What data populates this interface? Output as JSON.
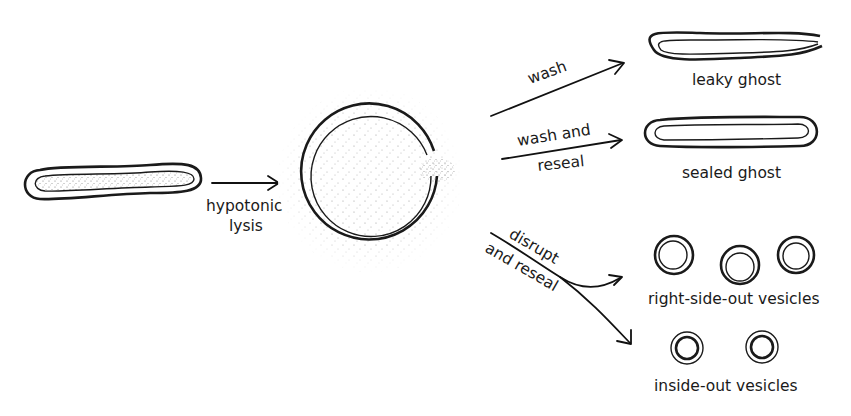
{
  "diagram": {
    "nodes": [
      {
        "id": "cell",
        "label": "",
        "shape": "rod with stippled cytoplasm"
      },
      {
        "id": "lysed",
        "label": "",
        "shape": "swollen circle with gap, stippled leakage"
      },
      {
        "id": "leaky",
        "label": "leaky ghost"
      },
      {
        "id": "sealed",
        "label": "sealed ghost"
      },
      {
        "id": "rso",
        "label": "right-side-out vesicles",
        "count": 3
      },
      {
        "id": "iso",
        "label": "inside-out vesicles",
        "count": 2
      }
    ],
    "edges": [
      {
        "from": "cell",
        "to": "lysed",
        "label_line1": "hypotonic",
        "label_line2": "lysis"
      },
      {
        "from": "lysed",
        "to": "leaky",
        "label": "wash"
      },
      {
        "from": "lysed",
        "to": "sealed",
        "label_line1": "wash and",
        "label_line2": "reseal"
      },
      {
        "from": "lysed",
        "to": "rso",
        "label_line1": "disrupt",
        "label_line2": "and reseal"
      },
      {
        "from": "lysed",
        "to": "iso",
        "label": ""
      }
    ]
  },
  "labels": {
    "hypotonic": "hypotonic",
    "lysis": "lysis",
    "wash": "wash",
    "wash_and": "wash and",
    "reseal": "reseal",
    "leaky_ghost": "leaky ghost",
    "sealed_ghost": "sealed ghost",
    "disrupt": "disrupt",
    "and_reseal": "and reseal",
    "right_side_out": "right-side-out vesicles",
    "inside_out": "inside-out vesicles"
  },
  "colors": {
    "ink": "#1a1a1a",
    "background": "#ffffff",
    "stipple": "#9a9a9a"
  }
}
